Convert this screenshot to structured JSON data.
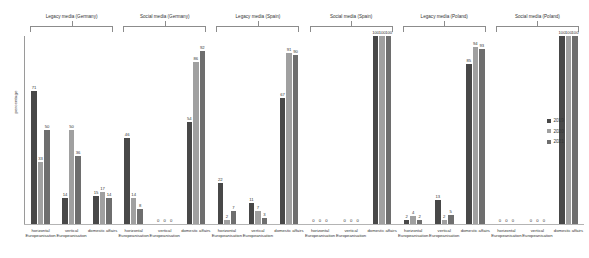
{
  "chart": {
    "type": "bar",
    "ylabel": "percentage",
    "title": "",
    "legend_position": "right"
  },
  "legend": {
    "items": [
      {
        "label": "2019",
        "color": "#484848"
      },
      {
        "label": "2020",
        "color": "#a0a0a0"
      },
      {
        "label": "2021",
        "color": "#6e6e6e"
      }
    ]
  },
  "groups": [
    {
      "header": "Legacy media (Germany)"
    },
    {
      "header": "Social media (Germany)"
    },
    {
      "header": "Legacy media (Spain)"
    },
    {
      "header": "Social media (Spain)"
    },
    {
      "header": "Legacy media (Poland)"
    },
    {
      "header": "Social media (Poland)"
    }
  ],
  "categories": [
    "horizontal Europeanisation",
    "vertical Europeanisation",
    "domestic affairs"
  ],
  "chart_data": {
    "type": "bar",
    "title": "",
    "xlabel": "",
    "ylabel": "percentage",
    "ylim": [
      0,
      100
    ],
    "grid": false,
    "legend_position": "right",
    "series_names": [
      "2019",
      "2020",
      "2021"
    ],
    "series_colors": [
      "#484848",
      "#a0a0a0",
      "#6e6e6e"
    ],
    "groups": [
      {
        "name": "Legacy media (Germany)",
        "categories": [
          {
            "label": "horizontal Europeanisation",
            "values": [
              71,
              33,
              50
            ]
          },
          {
            "label": "vertical Europeanisation",
            "values": [
              14,
              50,
              36
            ]
          },
          {
            "label": "domestic affairs",
            "values": [
              15,
              17,
              14
            ]
          }
        ]
      },
      {
        "name": "Social media (Germany)",
        "categories": [
          {
            "label": "horizontal Europeanisation",
            "values": [
              46,
              14,
              8
            ]
          },
          {
            "label": "vertical Europeanisation",
            "values": [
              0,
              0,
              0
            ]
          },
          {
            "label": "domestic affairs",
            "values": [
              54,
              86,
              92
            ]
          }
        ]
      },
      {
        "name": "Legacy media (Spain)",
        "categories": [
          {
            "label": "horizontal Europeanisation",
            "values": [
              22,
              2,
              7
            ]
          },
          {
            "label": "vertical Europeanisation",
            "values": [
              11,
              7,
              3
            ]
          },
          {
            "label": "domestic affairs",
            "values": [
              67,
              91,
              90
            ]
          }
        ]
      },
      {
        "name": "Social media (Spain)",
        "categories": [
          {
            "label": "horizontal Europeanisation",
            "values": [
              0,
              0,
              0
            ]
          },
          {
            "label": "vertical Europeanisation",
            "values": [
              0,
              0,
              0
            ]
          },
          {
            "label": "domestic affairs",
            "values": [
              100,
              100,
              100
            ]
          }
        ]
      },
      {
        "name": "Legacy media (Poland)",
        "categories": [
          {
            "label": "horizontal Europeanisation",
            "values": [
              2,
              4,
              2
            ]
          },
          {
            "label": "vertical Europeanisation",
            "values": [
              13,
              2,
              5
            ]
          },
          {
            "label": "domestic affairs",
            "values": [
              85,
              94,
              93
            ]
          }
        ]
      },
      {
        "name": "Social media (Poland)",
        "categories": [
          {
            "label": "horizontal Europeanisation",
            "values": [
              0,
              0,
              0
            ]
          },
          {
            "label": "vertical Europeanisation",
            "values": [
              0,
              0,
              0
            ]
          },
          {
            "label": "domestic affairs",
            "values": [
              100,
              100,
              100
            ]
          }
        ]
      }
    ]
  }
}
